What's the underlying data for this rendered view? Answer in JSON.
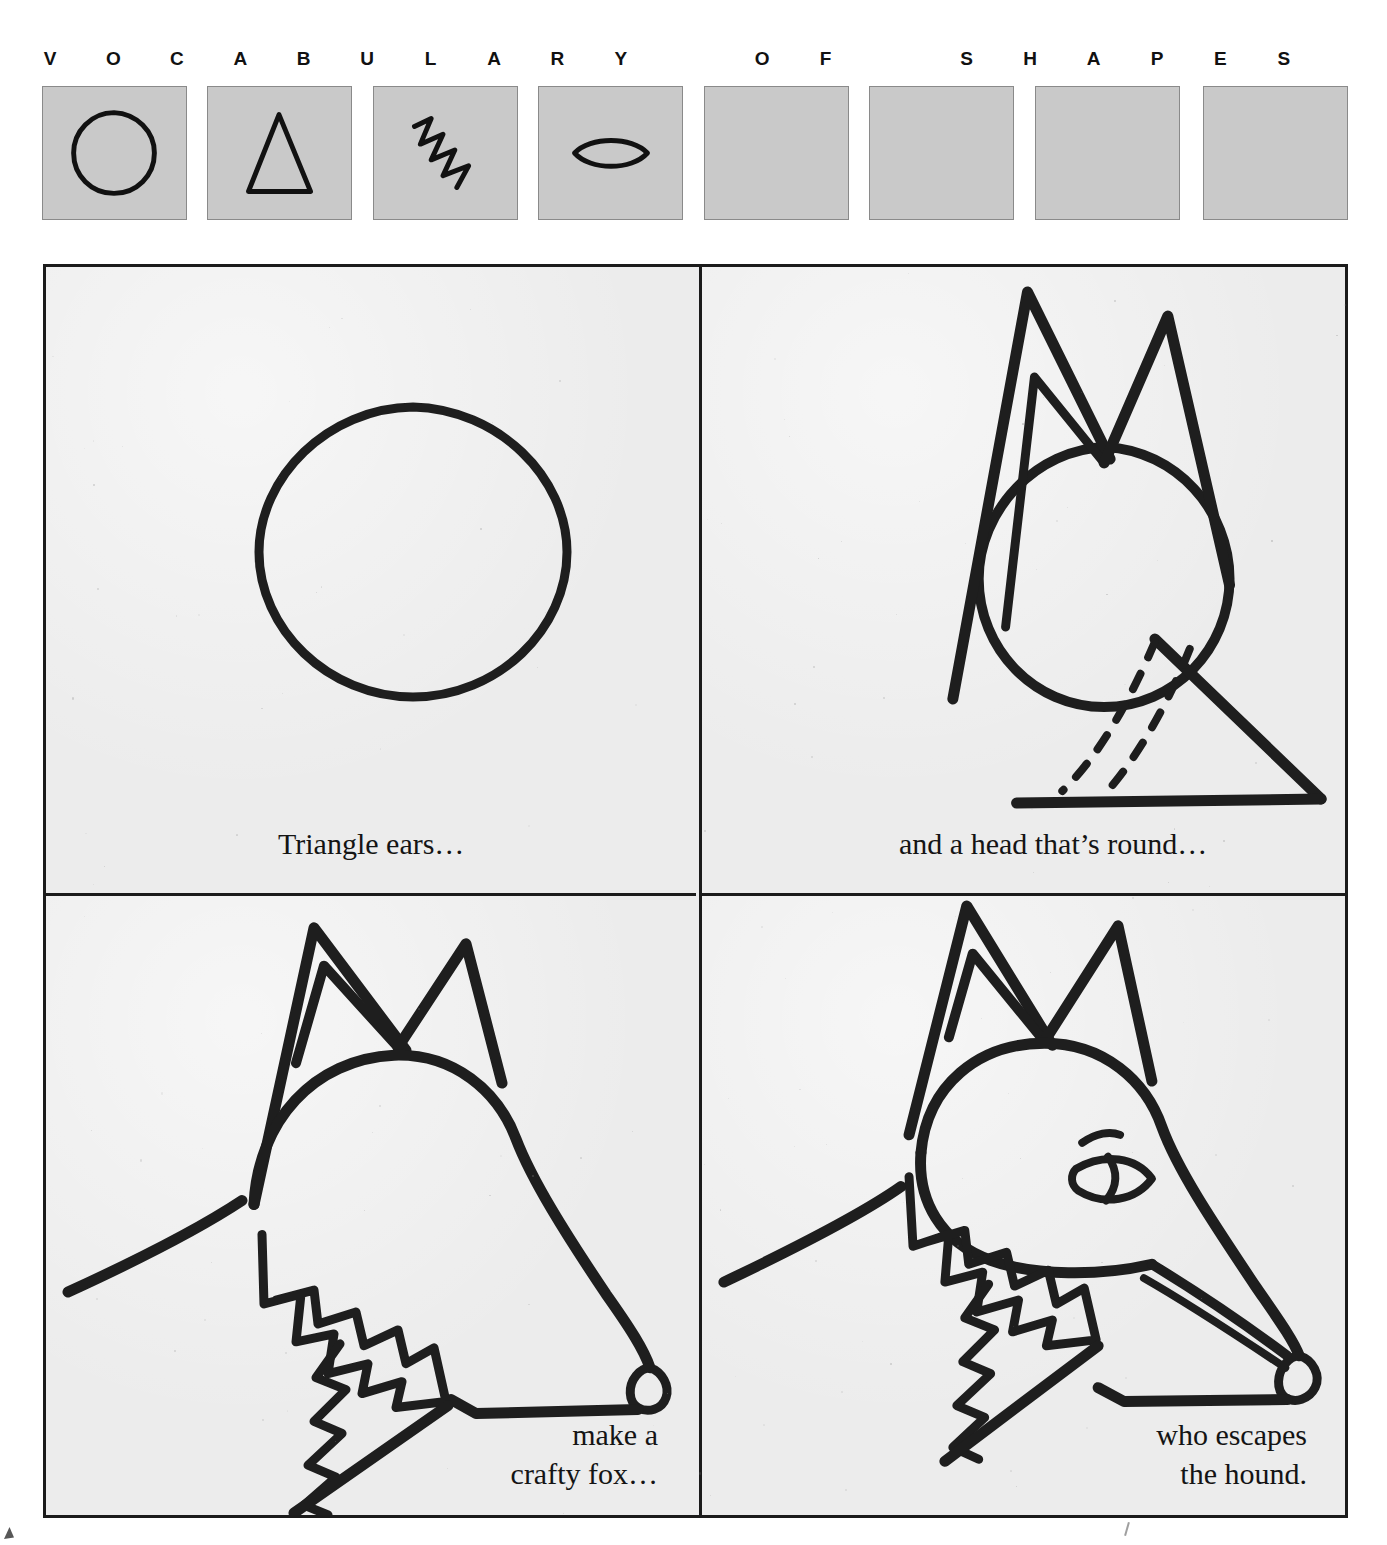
{
  "header": {
    "letters": [
      {
        "char": "V",
        "x": 14
      },
      {
        "char": "O",
        "x": 91
      },
      {
        "char": "C",
        "x": 168
      },
      {
        "char": "A",
        "x": 245
      },
      {
        "char": "B",
        "x": 322
      },
      {
        "char": "U",
        "x": 399
      },
      {
        "char": "L",
        "x": 476
      },
      {
        "char": "A",
        "x": 553
      },
      {
        "char": "R",
        "x": 630
      },
      {
        "char": "Y",
        "x": 707
      },
      {
        "char": "O",
        "x": 820
      },
      {
        "char": "F",
        "x": 897
      },
      {
        "char": "S",
        "x": 1010
      },
      {
        "char": "H",
        "x": 1087
      },
      {
        "char": "A",
        "x": 1164
      },
      {
        "char": "P",
        "x": 1241
      },
      {
        "char": "E",
        "x": 1306
      },
      {
        "char": "S",
        "x": 1306
      }
    ]
  },
  "shape_strip": {
    "box_fill": "#c9c9c9",
    "box_border": "#8a8a8a",
    "ink": "#111111",
    "boxes": [
      {
        "icon": "circle-shape-icon",
        "label": "circle",
        "x": 0,
        "filled": true
      },
      {
        "icon": "triangle-shape-icon",
        "label": "triangle",
        "x": 165,
        "filled": true
      },
      {
        "icon": "zigzag-shape-icon",
        "label": "zigzag",
        "x": 331,
        "filled": true
      },
      {
        "icon": "lens-shape-icon",
        "label": "lens",
        "x": 496,
        "filled": true
      },
      {
        "icon": "empty-shape-icon",
        "label": "empty",
        "x": 662,
        "filled": false
      },
      {
        "icon": "empty-shape-icon",
        "label": "empty",
        "x": 827,
        "filled": false
      },
      {
        "icon": "empty-shape-icon",
        "label": "empty",
        "x": 993,
        "filled": false
      },
      {
        "icon": "empty-shape-icon",
        "label": "empty",
        "x": 1161,
        "filled": false
      }
    ]
  },
  "panels": {
    "ink": "#1b1b1b",
    "paper": "#ececec",
    "items": [
      {
        "id": "panel-1",
        "name": "panel-circle-head",
        "caption": "Triangle ears…",
        "art_description": "a single hand-drawn circle"
      },
      {
        "id": "panel-2",
        "name": "panel-ears-and-snout",
        "caption": "and a head that’s round…",
        "art_description": "circle head with two triangle ears and a large triangle snout with dashed guide arcs"
      },
      {
        "id": "panel-3",
        "name": "panel-crafty-fox",
        "caption": "make a\ncrafty fox…",
        "art_description": "fox head profile with pointed ears, zigzag ruff and swept neck line"
      },
      {
        "id": "panel-4",
        "name": "panel-escaping-fox",
        "caption": "who escapes\nthe hound.",
        "art_description": "finished fox head with slit eye, brow, cheek line and open mouth"
      }
    ]
  },
  "page": {
    "background": "#ffffff"
  }
}
